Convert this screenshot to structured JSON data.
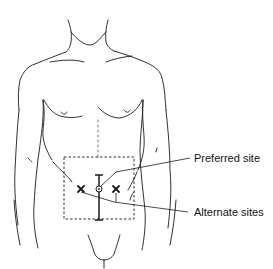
{
  "figure": {
    "labels": {
      "preferred": "Preferred site",
      "alternate": "Alternate sites"
    },
    "colors": {
      "line": "#1a1a1a",
      "background": "#ffffff"
    }
  }
}
